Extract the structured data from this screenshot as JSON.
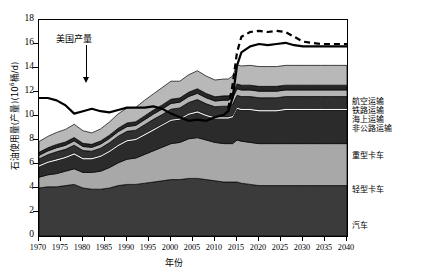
{
  "chart_data": {
    "type": "area",
    "title": "",
    "xlabel": "年份",
    "ylabel": "石油使用量(产量)(10⁶桶/d)",
    "ylabel_main": "石油使用量(产量)(10",
    "ylabel_sup": "6",
    "ylabel_tail": "桶/d)",
    "xlim": [
      1970,
      2040
    ],
    "ylim": [
      0,
      18
    ],
    "xticks": [
      1970,
      1975,
      1980,
      1985,
      1990,
      1995,
      2000,
      2005,
      2010,
      2015,
      2020,
      2025,
      2030,
      2035,
      2040
    ],
    "yticks": [
      0,
      2,
      4,
      6,
      8,
      10,
      12,
      14,
      16,
      18
    ],
    "grid": false,
    "stacked": true,
    "legend_position": "right-outside",
    "annotations": [
      {
        "text": "美国产量",
        "x": 1985,
        "y": 14.4,
        "arrow": "down",
        "arrow_to_y": 11.9
      }
    ],
    "x": [
      1970,
      1972,
      1974,
      1976,
      1978,
      1980,
      1982,
      1984,
      1986,
      1988,
      1990,
      1992,
      1994,
      1996,
      1998,
      2000,
      2002,
      2004,
      2006,
      2008,
      2010,
      2012,
      2013,
      2014,
      2015,
      2016,
      2018,
      2020,
      2022,
      2024,
      2026,
      2028,
      2030,
      2032,
      2034,
      2036,
      2038,
      2040
    ],
    "series": [
      {
        "name": "汽车",
        "label": "汽车",
        "color": "#3b3b3b",
        "values": [
          4.0,
          4.1,
          4.1,
          4.2,
          4.3,
          4.0,
          3.9,
          3.9,
          4.0,
          4.2,
          4.3,
          4.3,
          4.4,
          4.5,
          4.6,
          4.7,
          4.7,
          4.8,
          4.8,
          4.7,
          4.6,
          4.5,
          4.5,
          4.5,
          4.5,
          4.4,
          4.3,
          4.2,
          4.2,
          4.2,
          4.2,
          4.2,
          4.2,
          4.2,
          4.2,
          4.2,
          4.2,
          4.2
        ]
      },
      {
        "name": "轻型卡车",
        "label": "轻型卡车",
        "color": "#a8a8a8",
        "values": [
          0.9,
          1.0,
          1.1,
          1.2,
          1.3,
          1.3,
          1.4,
          1.5,
          1.7,
          1.9,
          2.1,
          2.2,
          2.4,
          2.6,
          2.8,
          3.0,
          3.1,
          3.3,
          3.4,
          3.3,
          3.2,
          3.2,
          3.2,
          3.2,
          3.5,
          3.5,
          3.5,
          3.5,
          3.5,
          3.5,
          3.5,
          3.5,
          3.5,
          3.5,
          3.5,
          3.5,
          3.5,
          3.5
        ]
      },
      {
        "name": "重型卡车",
        "label": "重型卡车",
        "color": "#2b2b2b",
        "values": [
          0.9,
          1.0,
          1.1,
          1.1,
          1.2,
          1.1,
          1.1,
          1.2,
          1.3,
          1.4,
          1.5,
          1.5,
          1.6,
          1.7,
          1.8,
          1.9,
          1.9,
          2.0,
          2.1,
          2.0,
          2.0,
          2.1,
          2.1,
          2.2,
          2.6,
          2.6,
          2.7,
          2.7,
          2.7,
          2.7,
          2.8,
          2.8,
          2.8,
          2.8,
          2.8,
          2.8,
          2.8,
          2.8
        ]
      },
      {
        "name": "gap-white",
        "label": "",
        "color": "#ffffff",
        "values": [
          0.12,
          0.12,
          0.12,
          0.12,
          0.12,
          0.12,
          0.12,
          0.12,
          0.12,
          0.12,
          0.12,
          0.12,
          0.12,
          0.12,
          0.12,
          0.12,
          0.12,
          0.12,
          0.12,
          0.12,
          0.12,
          0.12,
          0.12,
          0.12,
          0.12,
          0.12,
          0.12,
          0.12,
          0.12,
          0.12,
          0.12,
          0.12,
          0.12,
          0.12,
          0.12,
          0.12,
          0.12,
          0.12
        ]
      },
      {
        "name": "非公路运输",
        "label": "非公路运输",
        "color": "#303030",
        "values": [
          0.5,
          0.55,
          0.6,
          0.6,
          0.65,
          0.6,
          0.55,
          0.6,
          0.65,
          0.7,
          0.7,
          0.7,
          0.75,
          0.8,
          0.8,
          0.85,
          0.85,
          0.9,
          0.95,
          0.9,
          0.85,
          0.9,
          0.9,
          0.95,
          1.0,
          1.0,
          1.0,
          1.0,
          1.0,
          1.0,
          1.0,
          1.0,
          1.0,
          1.0,
          1.0,
          1.0,
          1.0,
          1.0
        ]
      },
      {
        "name": "海上运输",
        "label": "海上运输",
        "color": "#b4b4b4",
        "values": [
          0.3,
          0.32,
          0.34,
          0.34,
          0.36,
          0.34,
          0.32,
          0.34,
          0.36,
          0.38,
          0.4,
          0.4,
          0.42,
          0.44,
          0.46,
          0.48,
          0.48,
          0.5,
          0.52,
          0.5,
          0.48,
          0.5,
          0.5,
          0.52,
          0.55,
          0.55,
          0.55,
          0.55,
          0.55,
          0.55,
          0.55,
          0.55,
          0.55,
          0.55,
          0.55,
          0.55,
          0.55,
          0.55
        ]
      },
      {
        "name": "铁路运输",
        "label": "铁路运输",
        "color": "#262626",
        "values": [
          0.25,
          0.26,
          0.27,
          0.27,
          0.28,
          0.26,
          0.25,
          0.26,
          0.27,
          0.28,
          0.3,
          0.3,
          0.32,
          0.33,
          0.34,
          0.35,
          0.35,
          0.36,
          0.38,
          0.36,
          0.35,
          0.36,
          0.36,
          0.38,
          0.4,
          0.4,
          0.4,
          0.4,
          0.4,
          0.4,
          0.4,
          0.4,
          0.4,
          0.4,
          0.4,
          0.4,
          0.4,
          0.4
        ]
      },
      {
        "name": "航空运输",
        "label": "航空运输",
        "color": "#b8b8b8",
        "values": [
          0.9,
          0.95,
          1.0,
          1.05,
          1.1,
          1.05,
          0.95,
          1.0,
          1.1,
          1.2,
          1.25,
          1.2,
          1.3,
          1.35,
          1.45,
          1.5,
          1.4,
          1.45,
          1.5,
          1.45,
          1.4,
          1.4,
          1.4,
          1.45,
          1.6,
          1.6,
          1.65,
          1.65,
          1.65,
          1.65,
          1.65,
          1.65,
          1.65,
          1.65,
          1.65,
          1.65,
          1.65,
          1.65
        ]
      }
    ],
    "lines": [
      {
        "name": "美国产量",
        "style": "solid",
        "color": "#000000",
        "width": 2.2,
        "x": [
          1970,
          1972,
          1974,
          1976,
          1978,
          1980,
          1982,
          1984,
          1986,
          1988,
          1990,
          1992,
          1994,
          1996,
          1998,
          2000,
          2002,
          2004,
          2006,
          2008,
          2010,
          2012,
          2013,
          2014,
          2015,
          2016,
          2018,
          2020,
          2022,
          2024,
          2026,
          2028,
          2030,
          2032,
          2034,
          2036,
          2038,
          2040
        ],
        "values": [
          11.5,
          11.5,
          11.3,
          10.9,
          10.2,
          10.4,
          10.6,
          10.4,
          10.3,
          10.5,
          10.7,
          10.7,
          10.7,
          10.8,
          10.6,
          10.2,
          9.9,
          9.6,
          9.7,
          9.6,
          9.9,
          10.1,
          10.4,
          11.5,
          14.2,
          15.3,
          15.8,
          16.0,
          15.9,
          16.0,
          16.1,
          15.9,
          15.8,
          15.8,
          15.8,
          15.8,
          15.8,
          15.8
        ]
      },
      {
        "name": "美国产量-高情景",
        "style": "dashed",
        "color": "#000000",
        "width": 2.2,
        "x": [
          2013,
          2014,
          2015,
          2016,
          2018,
          2020,
          2022,
          2024,
          2026,
          2028,
          2030,
          2032,
          2034,
          2036,
          2038,
          2040
        ],
        "values": [
          10.6,
          12.6,
          15.3,
          16.6,
          17.0,
          17.1,
          17.0,
          17.1,
          17.0,
          16.6,
          16.2,
          16.1,
          16.0,
          16.0,
          16.0,
          16.0
        ]
      }
    ]
  },
  "legend": {
    "items": [
      {
        "label": "航空运输",
        "color": "#b8b8b8"
      },
      {
        "label": "铁路运输",
        "color": "#262626"
      },
      {
        "label": "海上运输",
        "color": "#b4b4b4"
      },
      {
        "label": "非公路运输",
        "color": "#303030"
      },
      {
        "label": "重型卡车",
        "color": "#2b2b2b"
      },
      {
        "label": "轻型卡车",
        "color": "#a8a8a8"
      },
      {
        "label": "汽车",
        "color": "#3b3b3b"
      }
    ]
  }
}
